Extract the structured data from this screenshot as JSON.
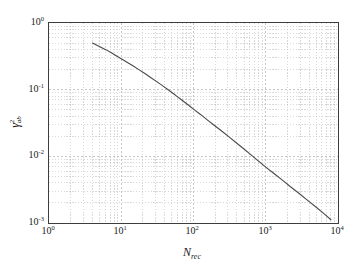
{
  "chart_data": {
    "type": "line",
    "title": "",
    "xlabel": "N_rec",
    "xlabel_base": "N",
    "xlabel_sub": "rec",
    "ylabel": "gamma^2_ab",
    "ylabel_base": "γ",
    "ylabel_sup": "2",
    "ylabel_sub": "ab",
    "xscale": "log",
    "yscale": "log",
    "xlim": [
      1,
      10000
    ],
    "ylim": [
      0.001,
      1
    ],
    "grid": "both-minor-and-major-dashed",
    "legend": "none",
    "x_ticks": [
      {
        "value": 1,
        "label": "10",
        "exp": "0"
      },
      {
        "value": 10,
        "label": "10",
        "exp": "1"
      },
      {
        "value": 100,
        "label": "10",
        "exp": "2"
      },
      {
        "value": 1000,
        "label": "10",
        "exp": "3"
      },
      {
        "value": 10000,
        "label": "10",
        "exp": "4"
      }
    ],
    "y_ticks": [
      {
        "value": 1,
        "label": "10",
        "exp": "0"
      },
      {
        "value": 0.1,
        "label": "10",
        "exp": "-1"
      },
      {
        "value": 0.01,
        "label": "10",
        "exp": "-2"
      },
      {
        "value": 0.001,
        "label": "10",
        "exp": "-3"
      }
    ],
    "series": [
      {
        "name": "gamma_ab_squared",
        "color": "#4a4a4a",
        "linewidth": 1.1,
        "x": [
          4.0,
          4.6,
          5.3,
          6.2,
          7.2,
          8.4,
          10.0,
          12.0,
          14.5,
          17.5,
          21.0,
          25.5,
          31.0,
          38.0,
          46.0,
          56.0,
          68.0,
          83.0,
          100.0,
          125.0,
          155.0,
          195.0,
          245.0,
          310.0,
          390.0,
          490.0,
          620.0,
          780.0,
          1000.0,
          1300.0,
          1700.0,
          2200.0,
          2900.0,
          3800.0,
          5000.0,
          6500.0,
          8000.0
        ],
        "y": [
          0.5,
          0.465,
          0.43,
          0.395,
          0.36,
          0.325,
          0.29,
          0.258,
          0.228,
          0.2,
          0.176,
          0.152,
          0.132,
          0.113,
          0.097,
          0.083,
          0.0705,
          0.06,
          0.051,
          0.0425,
          0.0352,
          0.029,
          0.024,
          0.0196,
          0.016,
          0.0131,
          0.0106,
          0.0086,
          0.0069,
          0.00552,
          0.0044,
          0.0035,
          0.00277,
          0.00218,
          0.00172,
          0.00136,
          0.00112
        ]
      }
    ],
    "xlim_log": [
      0,
      4
    ],
    "ylim_log": [
      -3,
      0
    ]
  },
  "axes": {
    "frame_color": "#3d3d3d",
    "grid_color": "#b9b9b9",
    "background": "#ffffff"
  }
}
